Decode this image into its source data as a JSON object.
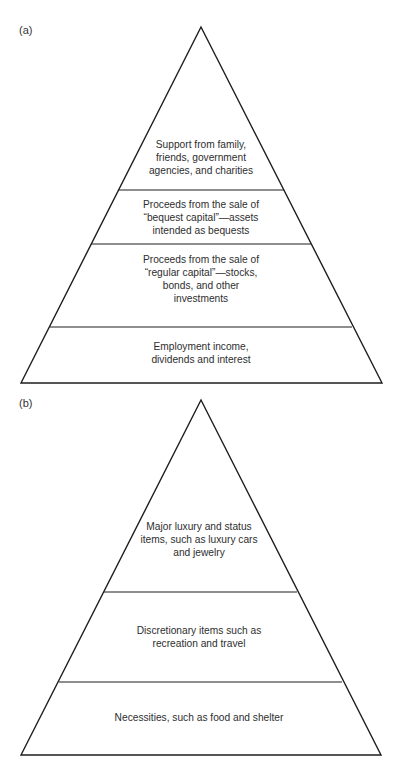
{
  "figure": {
    "panels": [
      {
        "label": "(a)",
        "tiers_top_to_bottom": [
          {
            "lines": [
              "Support from family,",
              "friends, government",
              "agencies, and charities"
            ]
          },
          {
            "lines": [
              "Proceeds from the sale of",
              "“bequest capital”—assets",
              "intended as bequests"
            ]
          },
          {
            "lines": [
              "Proceeds from the sale of",
              "“regular capital”—stocks,",
              "bonds, and other",
              "investments"
            ]
          },
          {
            "lines": [
              "Employment income,",
              "dividends and interest"
            ]
          }
        ]
      },
      {
        "label": "(b)",
        "tiers_top_to_bottom": [
          {
            "lines": [
              "Major luxury and status",
              "items, such as luxury cars",
              "and jewelry"
            ]
          },
          {
            "lines": [
              "Discretionary items such as",
              "recreation and travel"
            ]
          },
          {
            "lines": [
              "Necessities, such as food and shelter"
            ]
          }
        ]
      }
    ]
  },
  "colors": {
    "line": "#1e1e1e",
    "text": "#2e2e2e",
    "background": "#ffffff"
  }
}
